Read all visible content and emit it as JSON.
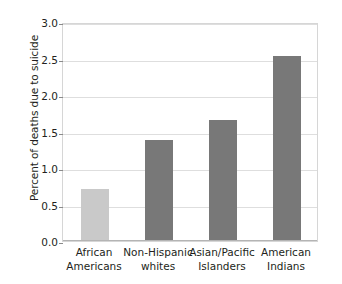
{
  "chart_data": {
    "type": "bar",
    "title": "",
    "subtitle": "",
    "xlabel": "",
    "ylabel": "Percent of deaths due to suicide",
    "ylim": [
      0.0,
      3.0
    ],
    "ytick_labels": [
      "3.0",
      "2.5",
      "2.0",
      "1.5",
      "1.0",
      "0.5",
      "0.0"
    ],
    "ytick_values": [
      3.0,
      2.5,
      2.0,
      1.5,
      1.0,
      0.5,
      0.0
    ],
    "grid": "horizontal",
    "legend": "none",
    "categories": [
      "African Americans",
      "Non-Hispanic whites",
      "Asian/Pacific Islanders",
      "American Indians"
    ],
    "category_lines": [
      [
        "African",
        "Americans"
      ],
      [
        "Non-Hispanic",
        "whites"
      ],
      [
        "Asian/Pacific",
        "Islanders"
      ],
      [
        "American",
        "Indians"
      ]
    ],
    "values": [
      0.71,
      1.39,
      1.66,
      2.53
    ],
    "bar_colors": [
      "#c9c9c9",
      "#787878",
      "#787878",
      "#787878"
    ],
    "colors": {
      "highlight_bar": "#c9c9c9",
      "standard_bar": "#787878",
      "gridline": "#dedede",
      "axis": "#b4b4b4",
      "text": "#231f20",
      "background": "#ffffff"
    }
  }
}
